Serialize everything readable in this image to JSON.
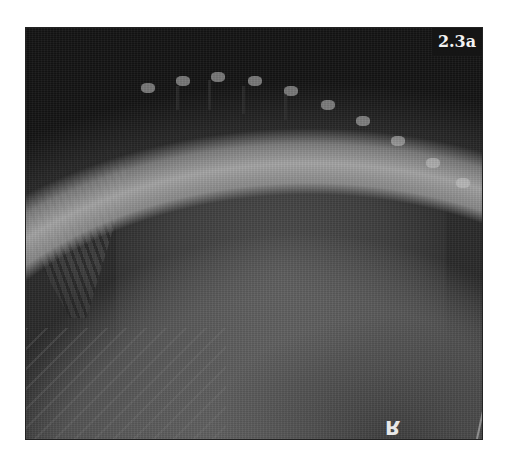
{
  "figure": {
    "label": "2.3a",
    "marker": "R",
    "colors": {
      "background": "#ffffff",
      "label_bg": "#151515",
      "label_text": "#f2f2f2",
      "xray_mid": "#5a5a5a"
    }
  }
}
